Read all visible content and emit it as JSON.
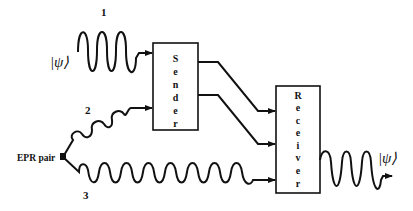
{
  "diagram": {
    "labels": {
      "channel_1": "1",
      "channel_2": "2",
      "channel_3": "3",
      "epr_pair": "EPR pair",
      "input_state": "|ψ⟩",
      "output_state": "|ψ⟩"
    },
    "blocks": {
      "sender": {
        "letters": [
          "S",
          "e",
          "n",
          "d",
          "e",
          "r"
        ]
      },
      "receiver": {
        "letters": [
          "R",
          "e",
          "c",
          "e",
          "i",
          "v",
          "e",
          "r"
        ]
      }
    },
    "colors": {
      "stroke": "#111111",
      "background": "#ffffff"
    }
  }
}
